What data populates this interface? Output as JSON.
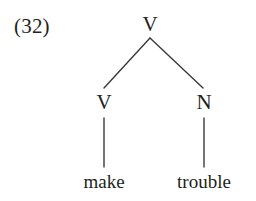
{
  "figure": {
    "example_number": "(32)",
    "background_color": "#ffffff",
    "ink_color": "#231f20",
    "width": 256,
    "height": 201
  },
  "tree": {
    "root": {
      "label": "V",
      "x": 150,
      "y": 32
    },
    "children": [
      {
        "label": "V",
        "x": 104,
        "y": 110,
        "terminal": {
          "label": "make",
          "x": 104,
          "y": 188
        }
      },
      {
        "label": "N",
        "x": 204,
        "y": 110,
        "terminal": {
          "label": "trouble",
          "x": 204,
          "y": 188
        }
      }
    ]
  },
  "lines": {
    "stroke_color": "#3a3a3a",
    "stroke_width": 1.4,
    "branch_left": {
      "x1": 150,
      "y1": 38,
      "x2": 104,
      "y2": 88
    },
    "branch_right": {
      "x1": 150,
      "y1": 38,
      "x2": 203,
      "y2": 88
    },
    "stem_left": {
      "x1": 104,
      "y1": 118,
      "x2": 104,
      "y2": 167
    },
    "stem_right": {
      "x1": 204,
      "y1": 118,
      "x2": 204,
      "y2": 167
    }
  }
}
